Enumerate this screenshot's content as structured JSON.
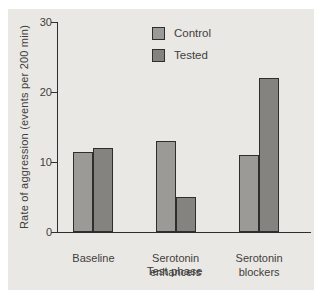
{
  "figure": {
    "panel_background": "#eae8e4",
    "margin_background": "#ffffff",
    "axis_color": "#2f2e2c",
    "text_color": "#3f3e3c"
  },
  "chart_data": {
    "type": "bar",
    "title": "",
    "xlabel": "Test phase",
    "ylabel": "Rate of aggression (events per 200 min)",
    "categories": [
      "Baseline",
      "Serotonin enhancers",
      "Serotonin blockers"
    ],
    "series": [
      {
        "name": "Control",
        "color": "#9c9a96",
        "values": [
          11.5,
          13,
          11
        ]
      },
      {
        "name": "Tested",
        "color": "#85837f",
        "values": [
          12,
          5,
          22
        ]
      }
    ],
    "ylim": [
      0,
      30
    ],
    "yticks": [
      0,
      10,
      20,
      30
    ],
    "grid": false,
    "legend_position": "top-center"
  }
}
